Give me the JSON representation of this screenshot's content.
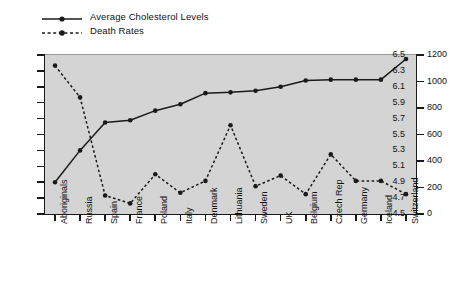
{
  "legend": {
    "position": "top-left",
    "entries": [
      {
        "label": "Average Cholesterol Levels",
        "style": "solid",
        "marker": "circle",
        "color": "#1a1a1a"
      },
      {
        "label": "Death Rates",
        "style": "dashed",
        "marker": "circle",
        "color": "#1a1a1a"
      }
    ]
  },
  "axes": {
    "left": {
      "ticks": [
        "6.5",
        "6.3",
        "6.1",
        "5.9",
        "5.7",
        "5.5",
        "5.3",
        "5.1",
        "4.9",
        "4.7",
        "4.5"
      ],
      "min": 4.5,
      "max": 6.5,
      "step": 0.2
    },
    "right": {
      "ticks": [
        "1200",
        "1000",
        "800",
        "600",
        "400",
        "200",
        "0"
      ],
      "min": 0,
      "max": 1200,
      "step": 200
    }
  },
  "chart_data": {
    "type": "line",
    "title": "",
    "subtitle": "",
    "xlabel": "",
    "ylabel": "",
    "y2label": "",
    "grid": false,
    "legend_position": "top-left",
    "plot_background": "#d4d4d4",
    "categories": [
      "Aboriginals",
      "Russia",
      "Spain",
      "France",
      "Poland",
      "Italy",
      "Denmark",
      "Lithuania",
      "Sweden",
      "UK",
      "Belgium",
      "Czech Rep",
      "Germany",
      "Iceland",
      "Switzerland"
    ],
    "series": [
      {
        "name": "Average Cholesterol Levels",
        "axis": "left",
        "style": "solid",
        "marker": "circle",
        "color": "#1a1a1a",
        "ylim": [
          4.5,
          6.5
        ],
        "values": [
          4.9,
          5.3,
          5.65,
          5.68,
          5.8,
          5.88,
          6.02,
          6.03,
          6.05,
          6.1,
          6.18,
          6.19,
          6.19,
          6.19,
          6.45
        ]
      },
      {
        "name": "Death Rates",
        "axis": "right",
        "style": "dashed",
        "marker": "circle",
        "color": "#1a1a1a",
        "ylim": [
          0,
          1200
        ],
        "values": [
          1120,
          880,
          140,
          80,
          300,
          160,
          250,
          670,
          210,
          290,
          150,
          450,
          250,
          250,
          150
        ]
      }
    ]
  }
}
